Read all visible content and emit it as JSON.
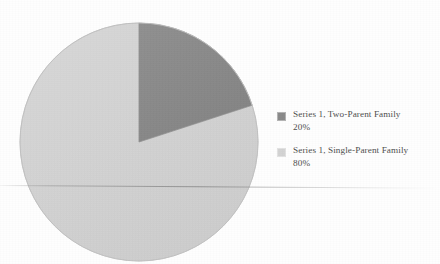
{
  "chart_data": {
    "type": "pie",
    "title": "",
    "subtitle": "",
    "xlabel": "",
    "ylabel": "",
    "legend_position": "right",
    "grid": false,
    "start_angle_deg": 0,
    "direction": "clockwise",
    "categories": [
      "Series 1, Two-Parent Family",
      "Series 1, Single-Parent Family"
    ],
    "values": [
      20,
      80
    ],
    "value_unit": "%",
    "value_labels": [
      "20%",
      "80%"
    ],
    "colors": [
      "#8a8a8a",
      "#d3d3d3"
    ],
    "series": [
      {
        "name": "Series 1",
        "slices": [
          {
            "label": "Series 1, Two-Parent Family",
            "value": 20,
            "value_label": "20%",
            "color": "#8a8a8a"
          },
          {
            "label": "Series 1, Single-Parent Family",
            "value": 80,
            "value_label": "80%",
            "color": "#d3d3d3"
          }
        ]
      }
    ]
  },
  "legend": {
    "entries": [
      {
        "label": "Series 1, Two-Parent Family",
        "value": "20%",
        "color": "#8a8a8a"
      },
      {
        "label": "Series 1, Single-Parent Family",
        "value": "80%",
        "color": "#d3d3d3"
      }
    ]
  },
  "pie": {
    "center_x": 120,
    "center_y": 120,
    "radius": 119,
    "slice_one_color": "#8a8a8a",
    "slice_two_color": "#d3d3d3",
    "edge_color": "#bdbdbd"
  }
}
